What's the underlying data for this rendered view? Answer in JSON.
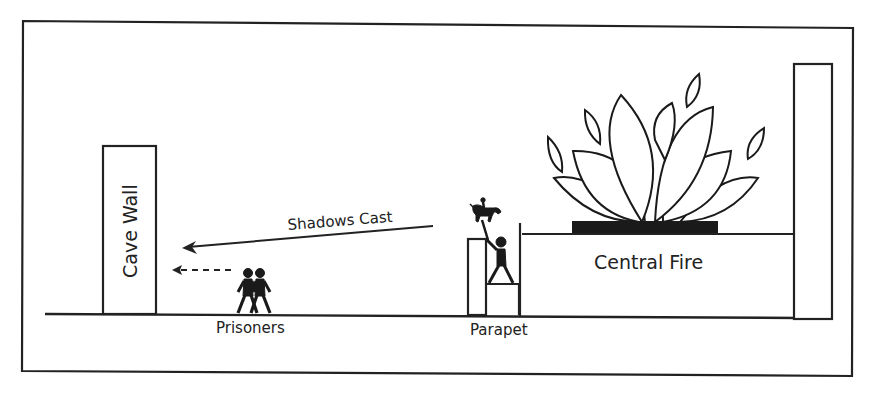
{
  "diagram": {
    "colors": {
      "stroke": "#222222",
      "fill_dark": "#1a1a1a",
      "background": "#ffffff"
    },
    "labels": {
      "cave_wall": "Cave Wall",
      "shadows": "Shadows Cast",
      "prisoners": "Prisoners",
      "parapet": "Parapet",
      "fire": "Central Fire"
    },
    "elements": [
      {
        "id": "cave-wall",
        "label": "Cave Wall",
        "shape": "tall rectangle"
      },
      {
        "id": "shadow-arrow",
        "label": "Shadows Cast",
        "shape": "solid arrow pointing left"
      },
      {
        "id": "gaze-arrow",
        "label": "",
        "shape": "dashed arrow pointing left"
      },
      {
        "id": "prisoners",
        "label": "Prisoners",
        "shape": "two stick figures"
      },
      {
        "id": "puppeteer",
        "label": "",
        "shape": "stick figure holding horse-and-rider figurine"
      },
      {
        "id": "parapet",
        "label": "Parapet",
        "shape": "low wall"
      },
      {
        "id": "fire",
        "label": "Central Fire",
        "shape": "flames on raised platform"
      },
      {
        "id": "back-wall",
        "label": "",
        "shape": "tall rectangle"
      }
    ]
  }
}
